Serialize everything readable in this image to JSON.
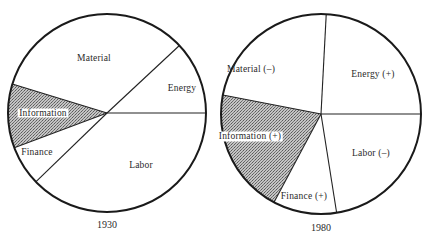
{
  "chart_data": [
    {
      "type": "pie",
      "title": "1930",
      "center": [
        107,
        113
      ],
      "radius": 99,
      "start_angle_deg": 0,
      "direction": "counterclockwise",
      "slices": [
        {
          "name": "Energy",
          "label": "Energy",
          "value": 12,
          "start": 0,
          "end": 43,
          "shaded": false,
          "label_pos": [
            182,
            91
          ]
        },
        {
          "name": "Material",
          "label": "Material",
          "value": 33,
          "start": 43,
          "end": 163,
          "shaded": false,
          "label_pos": [
            94,
            61
          ]
        },
        {
          "name": "Information",
          "label": "Information",
          "value": 10,
          "start": 163,
          "end": 200.5,
          "shaded": true,
          "label_pos": [
            43,
            116
          ]
        },
        {
          "name": "Finance",
          "label": "Finance",
          "value": 7,
          "start": 200.5,
          "end": 224,
          "shaded": false,
          "label_pos": [
            37,
            155
          ]
        },
        {
          "name": "Labor",
          "label": "Labor",
          "value": 38,
          "start": 224,
          "end": 360,
          "shaded": false,
          "label_pos": [
            141,
            168
          ]
        }
      ],
      "year_label_pos": [
        107,
        228
      ]
    },
    {
      "type": "pie",
      "title": "1980",
      "center": [
        321,
        114
      ],
      "radius": 100,
      "start_angle_deg": 0,
      "direction": "counterclockwise",
      "slices": [
        {
          "name": "Energy",
          "label": "Energy (+)",
          "value": 24,
          "start": 0,
          "end": 87,
          "shaded": false,
          "label_pos": [
            373,
            77
          ]
        },
        {
          "name": "Material",
          "label": "Material (–)",
          "value": 23,
          "start": 87,
          "end": 169,
          "shaded": false,
          "label_pos": [
            251,
            72
          ]
        },
        {
          "name": "Information",
          "label": "Information (+)",
          "value": 20,
          "start": 169,
          "end": 242,
          "shaded": true,
          "label_pos": [
            250,
            139
          ]
        },
        {
          "name": "Finance",
          "label": "Finance (+)",
          "value": 10,
          "start": 242,
          "end": 279,
          "shaded": false,
          "label_pos": [
            304,
            199
          ]
        },
        {
          "name": "Labor",
          "label": "Labor (–)",
          "value": 23,
          "start": 279,
          "end": 360,
          "shaded": false,
          "label_pos": [
            371,
            156
          ]
        }
      ],
      "year_label_pos": [
        321,
        231
      ]
    }
  ],
  "colors": {
    "outline": "#1a1a1a",
    "shade_dark": "#6e6e6e",
    "shade_light": "#c8c8c8",
    "background": "#ffffff"
  }
}
